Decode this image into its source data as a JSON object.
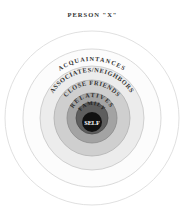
{
  "diagram": {
    "title": "PERSON \"X\"",
    "center": {
      "x": 92,
      "y": 118
    },
    "rings": [
      {
        "name": "acquaintances-outer",
        "label": "",
        "radius": 87,
        "fill": "#ffffff",
        "stroke": "#d8d8d8"
      },
      {
        "name": "acquaintances",
        "label": "ACQUAINTANCES",
        "radius": 69,
        "fill": "#fbfbfb",
        "stroke": "#d4d4d4"
      },
      {
        "name": "associates-neighbors",
        "label": "ASSOCIATES/NEIGHBORS",
        "radius": 52,
        "fill": "#e9e9e9",
        "stroke": "#c8c8c8"
      },
      {
        "name": "close-friends",
        "label": "CLOSE FRIENDS",
        "radius": 38,
        "fill": "#c9c9c9",
        "stroke": "#b0b0b0"
      },
      {
        "name": "relatives",
        "label": "RELATIVES",
        "radius": 25,
        "fill": "#9e9e9e",
        "stroke": "#8a8a8a"
      },
      {
        "name": "family",
        "label": "FAMILY",
        "radius": 16,
        "fill": "#5a5a5a",
        "stroke": "#4a4a4a"
      },
      {
        "name": "self",
        "label": "SELF",
        "radius": 10,
        "fill": "#111111",
        "stroke": "#111111"
      }
    ],
    "labels": {
      "acquaintances": "ACQUAINTANCES",
      "associates": "ASSOCIATES/NEIGHBORS",
      "close_friends": "CLOSE FRIENDS",
      "relatives": "RELATIVES",
      "family": "FAMILY",
      "self": "SELF"
    }
  }
}
